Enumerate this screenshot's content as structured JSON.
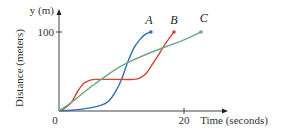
{
  "chart_data": {
    "type": "line",
    "title": "",
    "xlabel": "Time (seconds)",
    "ylabel": "Distance (meters)",
    "y_axis_unit_label": "y (m)",
    "origin_label": "0",
    "x_ticks": [
      {
        "value": 20,
        "label": "20"
      }
    ],
    "y_ticks": [
      {
        "value": 100,
        "label": "100"
      }
    ],
    "xlim": [
      0,
      27
    ],
    "ylim": [
      0,
      120
    ],
    "grid": false,
    "legend": "inline labels at line ends",
    "series": [
      {
        "name": "A",
        "color": "#2f6fb8",
        "x": [
          0,
          2,
          5,
          7,
          8,
          9,
          10,
          11,
          12,
          13,
          13.8,
          14.7
        ],
        "values": [
          0,
          1,
          4,
          8,
          13,
          24,
          40,
          62,
          80,
          91,
          97,
          100
        ]
      },
      {
        "name": "B",
        "color": "#d0492f",
        "x": [
          0,
          1,
          2,
          3,
          4,
          5,
          6,
          8,
          10,
          12,
          13,
          14,
          15,
          16,
          17,
          18.4
        ],
        "values": [
          0,
          4,
          11,
          25,
          35,
          39,
          40,
          40,
          40,
          40,
          42,
          48,
          60,
          72,
          85,
          100
        ]
      },
      {
        "name": "C",
        "color": "#6aa888",
        "x": [
          0,
          2,
          5,
          8,
          10,
          12,
          15,
          18,
          20,
          22.7
        ],
        "values": [
          0,
          11,
          30,
          47,
          57,
          65,
          75,
          84,
          90,
          100
        ]
      }
    ]
  }
}
